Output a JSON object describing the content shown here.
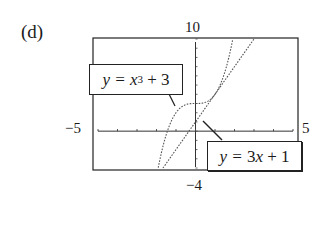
{
  "panel_label": "(d)",
  "window": {
    "xmin_label": "−5",
    "xmax_label": "5",
    "ymin_label": "−4",
    "ymax_label": "10"
  },
  "equations": {
    "cubic": {
      "lhs": "y = ",
      "var": "x",
      "exp": "3",
      "rest": " + 3"
    },
    "line": {
      "lhs": "y = ",
      "mid": "3",
      "var": "x",
      "rest": " + 1"
    }
  },
  "chart_data": {
    "type": "line",
    "title": "(d)",
    "xlabel": "",
    "ylabel": "",
    "xlim": [
      -5,
      5
    ],
    "ylim": [
      -4,
      10
    ],
    "xticks_step": 1,
    "yticks_step": 1,
    "grid": false,
    "legend": "callout labels",
    "series": [
      {
        "name": "y = x^3 + 3",
        "formula": "x^3 + 3",
        "style": "dotted",
        "x": [
          -1.91,
          -1.5,
          -1.0,
          -0.5,
          0,
          0.5,
          1.0,
          1.5,
          1.91
        ],
        "y": [
          -4,
          -0.375,
          2,
          2.875,
          3,
          3.125,
          4,
          6.375,
          10
        ]
      },
      {
        "name": "y = 3x + 1",
        "formula": "3x + 1",
        "style": "dotted",
        "x": [
          -1.67,
          0,
          1,
          2,
          3
        ],
        "y": [
          -4,
          1,
          4,
          7,
          10
        ]
      }
    ],
    "annotations": [
      "y = x³ + 3",
      "y = 3x + 1"
    ]
  }
}
